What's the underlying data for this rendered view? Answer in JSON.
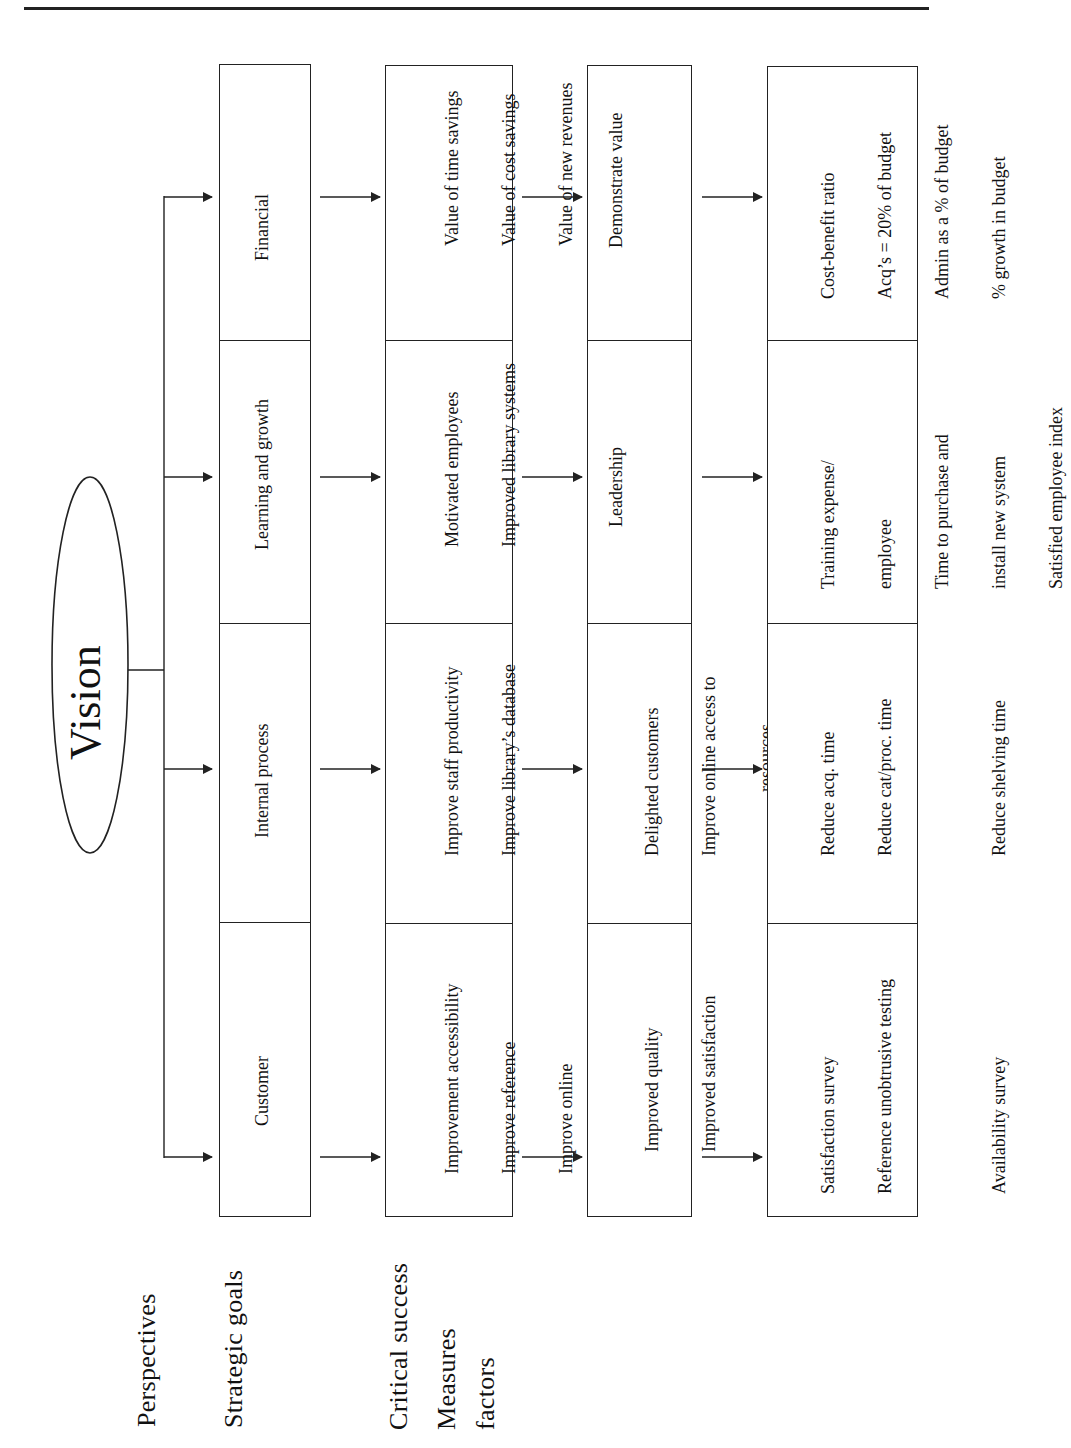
{
  "header": {
    "rule": "top-horizontal-rule"
  },
  "vision": {
    "label": "Vision"
  },
  "row_labels": [
    {
      "id": "perspectives",
      "label": "Perspectives"
    },
    {
      "id": "strategic-goals",
      "label": "Strategic goals"
    },
    {
      "id": "critical-success-factors",
      "label_line1": "Critical success",
      "label_line2": "factors"
    },
    {
      "id": "measures",
      "label": "Measures"
    }
  ],
  "perspectives": [
    {
      "label": "Customer"
    },
    {
      "label": "Internal process"
    },
    {
      "label": "Learning and growth"
    },
    {
      "label": "Financial"
    }
  ],
  "strategic_goals": [
    {
      "lines": [
        "Improvement accessibility",
        "Improve reference",
        "Improve online",
        "experience"
      ]
    },
    {
      "lines": [
        "Improve staff productivity",
        "Improve library’s database"
      ]
    },
    {
      "lines": [
        "Motivated employees",
        "Improved library systems"
      ]
    },
    {
      "lines": [
        "Value of time savings",
        "Value of cost savings",
        "Value of new revenues"
      ]
    }
  ],
  "critical_success_factors": [
    {
      "lines": [
        "Improved quality",
        "Improved satisfaction"
      ]
    },
    {
      "lines": [
        "Delighted customers",
        "Improve online access to",
        "resources"
      ]
    },
    {
      "lines": [
        "Leadership"
      ]
    },
    {
      "lines": [
        "Demonstrate value"
      ]
    }
  ],
  "measures": [
    {
      "lines": [
        "Satisfaction survey",
        "Reference unobtrusive testing",
        "",
        "Availability survey"
      ]
    },
    {
      "lines": [
        "Reduce acq. time",
        "Reduce cat/proc. time",
        "",
        "Reduce shelving time"
      ]
    },
    {
      "lines": [
        "Training expense/",
        "employee",
        "Time to purchase and",
        "install new system",
        "Satisfied employee index"
      ]
    },
    {
      "lines": [
        "Cost-benefit ratio",
        "Acq’s = 20% of budget",
        "Admin as a % of budget",
        "% growth in budget"
      ]
    }
  ],
  "colors": {
    "line": "#222222",
    "background": "#ffffff",
    "text": "#111111"
  }
}
